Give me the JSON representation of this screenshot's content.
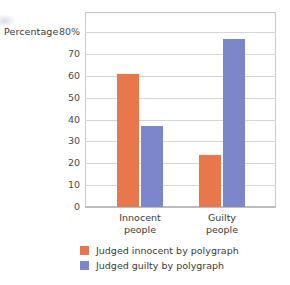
{
  "chart_data": {
    "type": "bar",
    "title": "",
    "subtitle": "",
    "xlabel": "",
    "ylabel": "Percentage",
    "ylim": [
      0,
      80
    ],
    "grid": true,
    "legend_position": "bottom",
    "categories": [
      "Innocent\npeople",
      "Guilty\npeople"
    ],
    "category_lines": [
      [
        "Innocent",
        "people"
      ],
      [
        "Guilty",
        "people"
      ]
    ],
    "ytick_labels": [
      "80%",
      "70",
      "60",
      "50",
      "40",
      "30",
      "20",
      "10",
      "0"
    ],
    "ytick_values": [
      80,
      70,
      60,
      50,
      40,
      30,
      20,
      10,
      0
    ],
    "series": [
      {
        "name": "Judged innocent by polygraph",
        "color": "#e8784c",
        "values": [
          61,
          24
        ]
      },
      {
        "name": "Judged guilty by polygraph",
        "color": "#7b86cb",
        "values": [
          37,
          77
        ]
      }
    ]
  },
  "legend": {
    "items": [
      {
        "label": "Judged innocent by polygraph",
        "color": "#e8784c"
      },
      {
        "label": "Judged guilty by polygraph",
        "color": "#7b86cb"
      }
    ]
  },
  "colors": {
    "orange": "#e8784c",
    "blue": "#7b86cb",
    "gridline": "#d5d5d5",
    "frame": "#c9c9c9",
    "text": "#3a3a3a",
    "background": "#ffffff"
  }
}
